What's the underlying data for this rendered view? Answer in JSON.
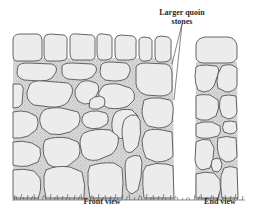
{
  "figure": {
    "labels": {
      "callout_line1": "Larger quoin",
      "callout_line2": "stones",
      "front_view": "Front view",
      "end_view": "End view"
    },
    "colors": {
      "stone_fill": "#ececec",
      "stone_outline": "#555555",
      "mortar_fill": "#d9d9d9",
      "grass": "#444444",
      "background": "#ffffff"
    }
  }
}
